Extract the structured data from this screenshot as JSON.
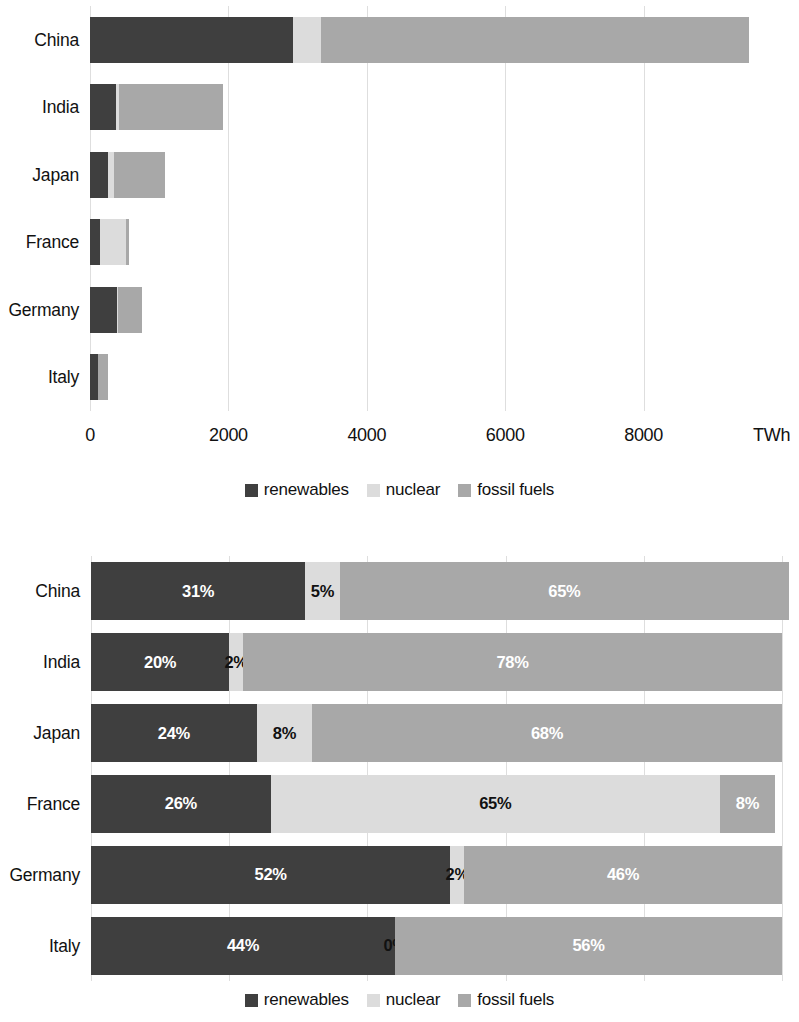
{
  "colors": {
    "renewables": "#3f3f3f",
    "nuclear": "#dcdcdc",
    "fossil_fuels": "#a8a8a8",
    "grid": "#dedede",
    "text": "#111111",
    "label_light": "#ffffff",
    "label_dark": "#111111",
    "background": "#ffffff"
  },
  "legend": {
    "items": [
      {
        "key": "renewables",
        "label": "renewables"
      },
      {
        "key": "nuclear",
        "label": "nuclear"
      },
      {
        "key": "fossil_fuels",
        "label": "fossil fuels"
      }
    ]
  },
  "chart_data": [
    {
      "id": "absolute-generation",
      "type": "bar",
      "orientation": "horizontal",
      "stacked": true,
      "title": "",
      "xlabel": "TWh",
      "ylabel": "",
      "unit": "TWh",
      "xlim": [
        0,
        10000
      ],
      "xticks": [
        0,
        2000,
        4000,
        6000,
        8000
      ],
      "xtick_labels": [
        "0",
        "2000",
        "4000",
        "6000",
        "8000"
      ],
      "grid": true,
      "legend_position": "bottom",
      "categories": [
        "China",
        "India",
        "Japan",
        "France",
        "Germany",
        "Italy"
      ],
      "series": [
        {
          "name": "renewables",
          "values": [
            2930,
            380,
            260,
            145,
            390,
            115
          ]
        },
        {
          "name": "nuclear",
          "values": [
            410,
            45,
            80,
            370,
            15,
            0
          ]
        },
        {
          "name": "fossil fuels",
          "values": [
            6180,
            1500,
            740,
            45,
            345,
            145
          ]
        }
      ],
      "totals": [
        9520,
        1925,
        1080,
        560,
        750,
        260
      ]
    },
    {
      "id": "share-of-generation",
      "type": "bar",
      "orientation": "horizontal",
      "stacked": true,
      "normalized": true,
      "title": "",
      "xlabel": "",
      "ylabel": "",
      "unit": "%",
      "xlim": [
        0,
        100
      ],
      "grid": true,
      "legend_position": "bottom",
      "categories": [
        "China",
        "India",
        "Japan",
        "France",
        "Germany",
        "Italy"
      ],
      "series": [
        {
          "name": "renewables",
          "values": [
            31,
            20,
            24,
            26,
            52,
            44
          ]
        },
        {
          "name": "nuclear",
          "values": [
            5,
            2,
            8,
            65,
            2,
            0
          ]
        },
        {
          "name": "fossil fuels",
          "values": [
            65,
            78,
            68,
            8,
            46,
            56
          ]
        }
      ],
      "data_labels": [
        [
          "31%",
          "5%",
          "65%"
        ],
        [
          "20%",
          "2%",
          "78%"
        ],
        [
          "24%",
          "8%",
          "68%"
        ],
        [
          "26%",
          "65%",
          "8%"
        ],
        [
          "52%",
          "2%",
          "46%"
        ],
        [
          "44%",
          "0%",
          "56%"
        ]
      ]
    }
  ]
}
